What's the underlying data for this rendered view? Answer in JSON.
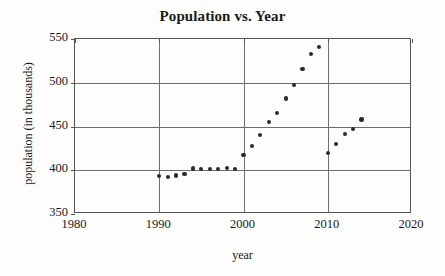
{
  "chart_data": {
    "type": "scatter",
    "title": "Population vs. Year",
    "xlabel": "year",
    "ylabel": "population (in thousands)",
    "xlim": [
      1980,
      2020
    ],
    "ylim": [
      350,
      550
    ],
    "xticks": [
      1980,
      1990,
      2000,
      2010,
      2020
    ],
    "yticks": [
      350,
      400,
      450,
      500,
      550
    ],
    "xtick_labels": [
      "1980",
      "1990",
      "2000",
      "2010",
      "2020"
    ],
    "ytick_labels": [
      "350",
      "400",
      "450",
      "500",
      "550"
    ],
    "grid": true,
    "legend": null,
    "marker_color": "#2b2b2b",
    "x": [
      1990,
      1991,
      1992,
      1993,
      1994,
      1995,
      1996,
      1997,
      1998,
      1999,
      2000,
      2001,
      2002,
      2003,
      2004,
      2005,
      2006,
      2007,
      2008,
      2009,
      2010,
      2011,
      2012,
      2013,
      2014
    ],
    "y": [
      393,
      392,
      394,
      396,
      402,
      401,
      401,
      401,
      403,
      401,
      417,
      428,
      440,
      455,
      465,
      482,
      497,
      516,
      533,
      541,
      420,
      430,
      441,
      447,
      458
    ],
    "points": [
      {
        "x": 1990,
        "y": 393
      },
      {
        "x": 1991,
        "y": 392
      },
      {
        "x": 1992,
        "y": 394
      },
      {
        "x": 1993,
        "y": 396
      },
      {
        "x": 1994,
        "y": 402
      },
      {
        "x": 1995,
        "y": 401
      },
      {
        "x": 1996,
        "y": 401
      },
      {
        "x": 1997,
        "y": 401
      },
      {
        "x": 1998,
        "y": 403
      },
      {
        "x": 1999,
        "y": 401
      },
      {
        "x": 2000,
        "y": 417
      },
      {
        "x": 2001,
        "y": 428
      },
      {
        "x": 2002,
        "y": 440
      },
      {
        "x": 2003,
        "y": 455
      },
      {
        "x": 2004,
        "y": 465
      },
      {
        "x": 2005,
        "y": 482
      },
      {
        "x": 2006,
        "y": 497
      },
      {
        "x": 2007,
        "y": 516
      },
      {
        "x": 2008,
        "y": 533
      },
      {
        "x": 2009,
        "y": 541
      },
      {
        "x": 2010,
        "y": 420
      },
      {
        "x": 2011,
        "y": 430
      },
      {
        "x": 2012,
        "y": 441
      },
      {
        "x": 2013,
        "y": 447
      },
      {
        "x": 2014,
        "y": 458
      }
    ]
  }
}
